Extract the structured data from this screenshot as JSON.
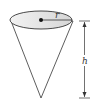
{
  "diagram": {
    "labels": {
      "radius": "r",
      "height": "h"
    },
    "colors": {
      "stroke": "#333333",
      "top_fill": "#e6e6e6",
      "body_fill": "#ffffff"
    }
  }
}
